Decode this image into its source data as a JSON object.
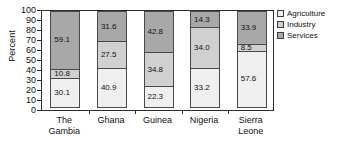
{
  "chart_data": {
    "type": "bar",
    "subtype": "stacked-bar-100",
    "title": "",
    "xlabel": "",
    "ylabel": "Percent",
    "ylim": [
      0,
      100
    ],
    "yticks": [
      100,
      90,
      80,
      70,
      60,
      50,
      40,
      30,
      20,
      10,
      0
    ],
    "grid": false,
    "legend_position": "right",
    "categories": [
      "The Gambia",
      "Ghana",
      "Guinea",
      "Nigeria",
      "Sierra Leone"
    ],
    "series": [
      {
        "name": "Agriculture",
        "color": "#efefef",
        "values": [
          30.1,
          40.9,
          22.3,
          33.2,
          57.6
        ]
      },
      {
        "name": "Industry",
        "color": "#d0d0d0",
        "values": [
          10.8,
          27.5,
          34.8,
          34.0,
          8.5
        ]
      },
      {
        "name": "Services",
        "color": "#a8a8a8",
        "values": [
          59.1,
          31.6,
          42.8,
          14.3,
          33.9
        ]
      }
    ],
    "stack_order_top_to_bottom": [
      "Services",
      "Industry",
      "Agriculture"
    ]
  },
  "axis": {
    "y_title": "Percent",
    "y_ticks": [
      "100",
      "90",
      "80",
      "70",
      "60",
      "50",
      "40",
      "30",
      "20",
      "10",
      "0"
    ]
  },
  "x_categories": [
    {
      "line1": "The",
      "line2": "Gambia"
    },
    {
      "line1": "Ghana",
      "line2": ""
    },
    {
      "line1": "Guinea",
      "line2": ""
    },
    {
      "line1": "Nigeria",
      "line2": ""
    },
    {
      "line1": "Sierra",
      "line2": "Leone"
    }
  ],
  "bars": [
    {
      "name": "The Gambia",
      "segments": [
        {
          "series": "Services",
          "value": "59.1",
          "pct": 59.1
        },
        {
          "series": "Industry",
          "value": "10.8",
          "pct": 10.8
        },
        {
          "series": "Agriculture",
          "value": "30.1",
          "pct": 30.1
        }
      ]
    },
    {
      "name": "Ghana",
      "segments": [
        {
          "series": "Services",
          "value": "31.6",
          "pct": 31.6
        },
        {
          "series": "Industry",
          "value": "27.5",
          "pct": 27.5
        },
        {
          "series": "Agriculture",
          "value": "40.9",
          "pct": 40.9
        }
      ]
    },
    {
      "name": "Guinea",
      "segments": [
        {
          "series": "Services",
          "value": "42.8",
          "pct": 42.8
        },
        {
          "series": "Industry",
          "value": "34.8",
          "pct": 34.8
        },
        {
          "series": "Agriculture",
          "value": "22.3",
          "pct": 22.3
        }
      ]
    },
    {
      "name": "Nigeria",
      "segments": [
        {
          "series": "Services",
          "value": "14.3",
          "pct": 17.5
        },
        {
          "series": "Industry",
          "value": "34.0",
          "pct": 41.7
        },
        {
          "series": "Agriculture",
          "value": "33.2",
          "pct": 40.8
        }
      ]
    },
    {
      "name": "Sierra Leone",
      "segments": [
        {
          "series": "Services",
          "value": "33.9",
          "pct": 33.9
        },
        {
          "series": "Industry",
          "value": "8.5",
          "pct": 8.5
        },
        {
          "series": "Agriculture",
          "value": "57.6",
          "pct": 57.6
        }
      ]
    }
  ],
  "legend": {
    "items": [
      {
        "label": "Agriculture",
        "color": "#efefef"
      },
      {
        "label": "Industry",
        "color": "#d0d0d0"
      },
      {
        "label": "Services",
        "color": "#a8a8a8"
      }
    ]
  }
}
